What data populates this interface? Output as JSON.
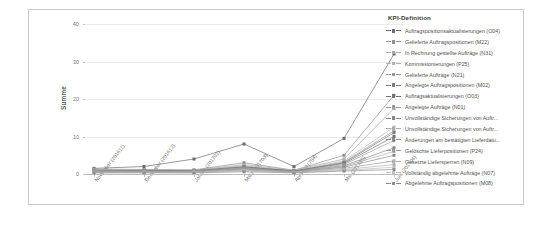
{
  "legend": {
    "title": "KPI-Definition",
    "entries": [
      {
        "label": "Auftragspositionsaktualisierungen (O04)",
        "color": "#6b6b6b"
      },
      {
        "label": "Gelieferte Auftragspositionen (M22)",
        "color": "#8f8f8f"
      },
      {
        "label": "In Rechnung gestellte Aufträge (N31)",
        "color": "#a8a8a8"
      },
      {
        "label": "Kommissionierungen (P25)",
        "color": "#b4b4b4"
      },
      {
        "label": "Gelieferte Aufträge (N21)",
        "color": "#9a9a9a"
      },
      {
        "label": "Angelegte Auftragspositionen (M02)",
        "color": "#7d7d7d"
      },
      {
        "label": "Auftragsaktualisierungen (O03)",
        "color": "#727272"
      },
      {
        "label": "Angelegte Aufträge (N01)",
        "color": "#9e9e9e"
      },
      {
        "label": "Unvollständige Sicherungen von Auftr...",
        "color": "#868686"
      },
      {
        "label": "Unvollständige Sicherungen von Auftr...",
        "color": "#ababab"
      },
      {
        "label": "Änderungen am bestätigten Lieferdatu...",
        "color": "#8a8a8a"
      },
      {
        "label": "Gelöschte Lieferpositionen (P24)",
        "color": "#9c9c9c"
      },
      {
        "label": "Gesetzte Liefersperren (N09)",
        "color": "#b0b0b0"
      },
      {
        "label": "Vollständig abgelehnte Aufträge (N07)",
        "color": "#c0c0c0"
      },
      {
        "label": "Abgelehnte Auftragspositionen (M08)",
        "color": "#8d8d8d"
      }
    ]
  },
  "caption": "",
  "chart_data": {
    "type": "line",
    "title": "",
    "xlabel": "",
    "ylabel": "Summe",
    "ylim": [
      0,
      40
    ],
    "yticks": [
      0,
      10,
      20,
      30,
      40
    ],
    "grid": true,
    "legend_position": "right",
    "categories": [
      "November (201611)",
      "Dezember (201612)",
      "Januar (201701)",
      "März (201703)",
      "April (201704)",
      "Mai (201705)",
      "Juni (201706)"
    ],
    "series": [
      {
        "name": "Auftragspositionsaktualisierungen (O04)",
        "color": "#6b6b6b",
        "values": [
          1.5,
          2.0,
          4.0,
          8.0,
          2.0,
          9.5,
          32.0
        ]
      },
      {
        "name": "Gelieferte Auftragspositionen (M22)",
        "color": "#8f8f8f",
        "values": [
          1.3,
          1.2,
          1.1,
          3.0,
          1.0,
          5.0,
          21.0
        ]
      },
      {
        "name": "In Rechnung gestellte Aufträge (N31)",
        "color": "#a8a8a8",
        "values": [
          1.2,
          1.1,
          1.0,
          2.5,
          1.0,
          4.0,
          17.5
        ]
      },
      {
        "name": "Kommissionierungen (P25)",
        "color": "#b4b4b4",
        "values": [
          1.1,
          1.0,
          1.0,
          2.2,
          0.9,
          3.5,
          12.5
        ]
      },
      {
        "name": "Gelieferte Aufträge (N21)",
        "color": "#9a9a9a",
        "values": [
          1.0,
          1.0,
          0.9,
          2.0,
          0.8,
          3.2,
          11.5
        ]
      },
      {
        "name": "Angelegte Auftragspositionen (M02)",
        "color": "#7d7d7d",
        "values": [
          1.0,
          0.9,
          0.9,
          1.9,
          0.8,
          3.0,
          11.0
        ]
      },
      {
        "name": "Auftragsaktualisierungen (O03)",
        "color": "#727272",
        "values": [
          0.9,
          0.9,
          0.8,
          1.8,
          0.8,
          2.8,
          10.0
        ]
      },
      {
        "name": "Angelegte Aufträge (N01)",
        "color": "#9e9e9e",
        "values": [
          0.9,
          0.8,
          0.8,
          1.6,
          0.7,
          2.5,
          9.0
        ]
      },
      {
        "name": "Unvollständige Sicherungen von Auftr...",
        "color": "#868686",
        "values": [
          0.8,
          0.8,
          0.7,
          1.5,
          0.7,
          2.2,
          7.0
        ]
      },
      {
        "name": "Unvollständige Sicherungen von Auftr...",
        "color": "#ababab",
        "values": [
          0.8,
          0.7,
          0.7,
          1.4,
          0.6,
          2.0,
          6.0
        ]
      },
      {
        "name": "Änderungen am bestätigten Lieferdatu...",
        "color": "#8a8a8a",
        "values": [
          0.7,
          0.7,
          0.6,
          1.3,
          0.6,
          1.8,
          5.0
        ]
      },
      {
        "name": "Gelöschte Lieferpositionen (P24)",
        "color": "#9c9c9c",
        "values": [
          0.6,
          0.6,
          0.6,
          1.1,
          0.5,
          1.5,
          3.5
        ]
      },
      {
        "name": "Gesetzte Liefersperren (N09)",
        "color": "#b0b0b0",
        "values": [
          0.5,
          0.5,
          0.5,
          1.0,
          0.5,
          1.2,
          2.5
        ]
      },
      {
        "name": "Vollständig abgelehnte Aufträge (N07)",
        "color": "#c0c0c0",
        "values": [
          0.4,
          0.4,
          0.4,
          0.8,
          0.4,
          1.0,
          1.8
        ]
      },
      {
        "name": "Abgelehnte Auftragspositionen (M08)",
        "color": "#8d8d8d",
        "values": [
          0.3,
          0.3,
          0.3,
          0.6,
          0.3,
          0.8,
          1.2
        ]
      }
    ]
  }
}
